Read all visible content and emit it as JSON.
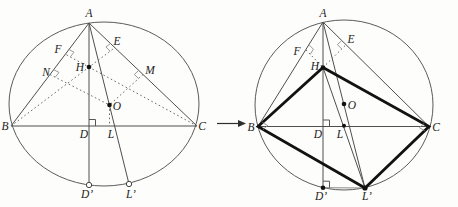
{
  "diagram": {
    "description_colors": {
      "line": "#4f4f4f",
      "dotted": "#6a6a6a",
      "bold_quadrilateral": "#121212",
      "angle_mark": "#8f8f8f",
      "text": "#1c1c1c",
      "background": "#fdfdfb"
    },
    "left_figure": {
      "labels": {
        "A": "A",
        "B": "B",
        "C": "C",
        "D": "D",
        "L": "L",
        "Dp": "D’",
        "Lp": "L’",
        "H": "H",
        "O": "O",
        "E": "E",
        "F": "F",
        "N": "N",
        "M": "M"
      }
    },
    "right_figure": {
      "labels": {
        "A": "A",
        "B": "B",
        "C": "C",
        "D": "D",
        "L": "L",
        "Dp": "D’",
        "Lp": "L’",
        "H": "H",
        "O": "O",
        "E": "E",
        "F": "F"
      }
    }
  }
}
